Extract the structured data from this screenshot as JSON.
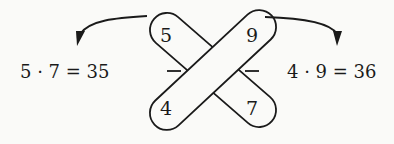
{
  "diagram": {
    "numbers": {
      "top_left": "5",
      "top_right": "9",
      "bottom_left": "4",
      "bottom_right": "7"
    },
    "left_equation": "5 · 7 = 35",
    "right_equation": "4 · 9 = 36",
    "fraction_bar_left": "–",
    "fraction_bar_right": "–",
    "colors": {
      "ink": "#1a1a1a",
      "paper": "#fafaf8"
    }
  }
}
